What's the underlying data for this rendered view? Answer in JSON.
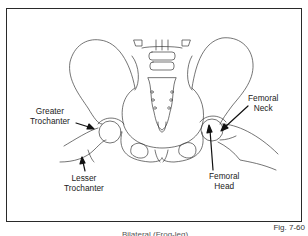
{
  "figure": {
    "number": "Fig. 7-60",
    "caption_partial": "Bilateral (Frog-leg)"
  },
  "labels": {
    "greater_trochanter": [
      "Greater",
      "Trochanter"
    ],
    "lesser_trochanter": [
      "Lesser",
      "Trochanter"
    ],
    "femoral_neck": [
      "Femoral",
      "Neck"
    ],
    "femoral_head": [
      "Femoral",
      "Head"
    ]
  },
  "colors": {
    "line": "#3a3a3a",
    "arrow": "#111111",
    "frame": "#2a2a2a"
  }
}
